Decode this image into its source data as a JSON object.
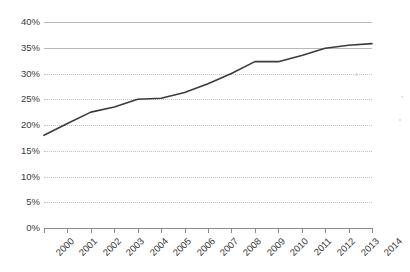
{
  "chart_data": {
    "type": "line",
    "title": "",
    "subtitle": "",
    "xlabel": "",
    "ylabel": "",
    "categories": [
      "2000",
      "2001",
      "2002",
      "2003",
      "2004",
      "2005",
      "2006",
      "2007",
      "2008",
      "2009",
      "2010",
      "2011",
      "2012",
      "2013",
      "2014"
    ],
    "x": [
      2000,
      2001,
      2002,
      2003,
      2004,
      2005,
      2006,
      2007,
      2008,
      2009,
      2010,
      2011,
      2012,
      2013,
      2014
    ],
    "values": [
      18.0,
      20.3,
      22.5,
      23.5,
      25.0,
      25.2,
      26.3,
      28.0,
      30.0,
      32.3,
      32.3,
      33.5,
      34.9,
      35.5,
      35.8
    ],
    "series": [
      {
        "name": "",
        "values": [
          18.0,
          20.3,
          22.5,
          23.5,
          25.0,
          25.2,
          26.3,
          28.0,
          30.0,
          32.3,
          32.3,
          33.5,
          34.9,
          35.5,
          35.8
        ]
      }
    ],
    "ylim": [
      0,
      40
    ],
    "xlim": [
      2000,
      2014
    ],
    "ytick_labels": [
      "0%",
      "5%",
      "10%",
      "15%",
      "20%",
      "25%",
      "30%",
      "35%",
      "40%"
    ],
    "ytick_values": [
      0,
      5,
      10,
      15,
      20,
      25,
      30,
      35,
      40
    ],
    "xtick_labels": [
      "2000",
      "2001",
      "2002",
      "2003",
      "2004",
      "2005",
      "2006",
      "2007",
      "2008",
      "2009",
      "2010",
      "2011",
      "2012",
      "2013",
      "2014"
    ],
    "grid": true,
    "grid_solid_above": 30,
    "legend": "none",
    "legend_position": "none",
    "annotations": [],
    "colors": {
      "line": "#3b3b3b",
      "gridline_solid": "#b9b9b9",
      "gridline_dotted": "#c2c2c2",
      "axis": "#8a8a8a",
      "tick_text": "#3a3a3a",
      "background": "#ffffff"
    }
  }
}
